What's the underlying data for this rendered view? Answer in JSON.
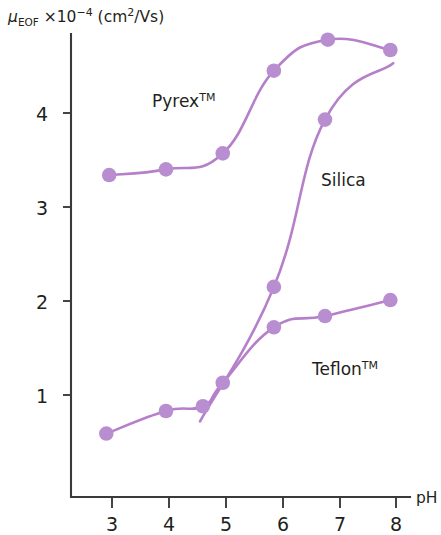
{
  "figure": {
    "background_color": "#ffffff",
    "axis_color": "#3a3a3c",
    "text_color": "#231f20",
    "curve_color": "#b57fc9",
    "point_color": "#b98ed0"
  },
  "axes": {
    "ylabel_mu": "μ",
    "ylabel_sub": "EOF",
    "ylabel_mid": " ×10",
    "ylabel_exp": "−4",
    "ylabel_unit_open": " (cm",
    "ylabel_unit_sup": "2",
    "ylabel_unit_close": "/Vs)",
    "xlabel": "pH",
    "y_ticks": [
      "1",
      "2",
      "3",
      "4"
    ],
    "x_ticks": [
      "3",
      "4",
      "5",
      "6",
      "7",
      "8"
    ],
    "xlim": [
      2.35,
      8.35
    ],
    "ylim": [
      0.0,
      5.15
    ],
    "grid": false
  },
  "series_labels": {
    "pyrex": "Pyrex",
    "pyrex_tm": "TM",
    "silica": "Silica",
    "teflon": "Teflon",
    "teflon_tm": "TM"
  },
  "chart_data": {
    "type": "scatter",
    "title": "",
    "xlabel": "pH",
    "ylabel": "μ_EOF ×10⁻⁴ (cm²/Vs)",
    "xlim": [
      2.35,
      8.35
    ],
    "ylim": [
      0.0,
      5.15
    ],
    "xticks": [
      3,
      4,
      5,
      6,
      7,
      8
    ],
    "yticks": [
      1,
      2,
      3,
      4
    ],
    "grid": false,
    "legend": "inline-annotations",
    "series": [
      {
        "name": "Pyrex",
        "label": "Pyrex™",
        "color": "#b57fc9",
        "x": [
          2.95,
          3.95,
          4.95,
          5.85,
          6.8,
          7.9
        ],
        "y": [
          3.34,
          3.4,
          3.57,
          4.45,
          4.78,
          4.67
        ]
      },
      {
        "name": "Silica",
        "label": "Silica",
        "color": "#b57fc9",
        "x": [
          5.85,
          6.75
        ],
        "y": [
          2.15,
          3.93
        ],
        "curve_start_ph": 4.55,
        "curve_start_value": 0.72,
        "curve_end_ph": 7.95,
        "curve_end_value": 4.53
      },
      {
        "name": "Teflon",
        "label": "Teflon™",
        "color": "#b57fc9",
        "x": [
          2.9,
          3.95,
          4.6,
          4.95,
          5.85,
          6.75,
          7.9
        ],
        "y": [
          0.59,
          0.83,
          0.88,
          1.13,
          1.72,
          1.84,
          2.01
        ]
      }
    ]
  }
}
